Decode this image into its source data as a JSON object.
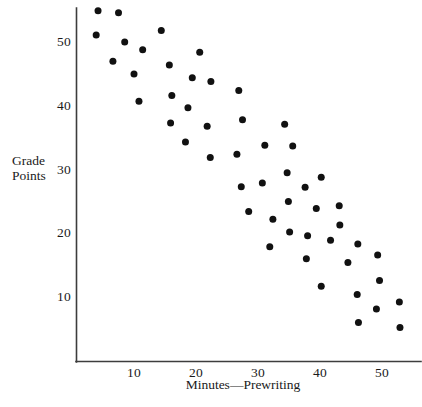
{
  "chart_data": {
    "type": "scatter",
    "title": "",
    "xlabel": "Minutes—Prewriting",
    "ylabel": "Grade Points",
    "ylabel_lines": [
      "Grade",
      "Points"
    ],
    "xlim": [
      0,
      56
    ],
    "ylim": [
      2,
      56
    ],
    "xticks": [
      10,
      20,
      30,
      40,
      50
    ],
    "xticklabels": [
      "10",
      "20",
      "30",
      "40",
      "50"
    ],
    "yticks": [
      10,
      20,
      30,
      40,
      50
    ],
    "yticklabels": [
      "10",
      "20",
      "30",
      "40",
      "50"
    ],
    "grid": false,
    "legend": null,
    "marker": "filled-circle",
    "marker_color": "#111111",
    "axis_color": "#3d3d3d",
    "points": [
      [
        4.2,
        54.9
      ],
      [
        3.9,
        51.1
      ],
      [
        7.5,
        54.6
      ],
      [
        8.5,
        50.0
      ],
      [
        6.6,
        47.0
      ],
      [
        11.4,
        48.8
      ],
      [
        10.0,
        45.0
      ],
      [
        10.8,
        40.7
      ],
      [
        14.4,
        51.8
      ],
      [
        15.7,
        46.4
      ],
      [
        16.1,
        41.6
      ],
      [
        15.9,
        37.3
      ],
      [
        20.6,
        48.4
      ],
      [
        19.4,
        44.4
      ],
      [
        18.7,
        39.7
      ],
      [
        18.3,
        34.3
      ],
      [
        22.4,
        43.8
      ],
      [
        21.8,
        36.8
      ],
      [
        22.3,
        31.9
      ],
      [
        26.9,
        42.4
      ],
      [
        27.5,
        37.8
      ],
      [
        26.6,
        32.4
      ],
      [
        27.3,
        27.3
      ],
      [
        28.5,
        23.4
      ],
      [
        31.1,
        33.8
      ],
      [
        30.7,
        27.9
      ],
      [
        32.4,
        22.2
      ],
      [
        31.9,
        17.9
      ],
      [
        34.3,
        37.1
      ],
      [
        35.6,
        33.7
      ],
      [
        34.7,
        29.5
      ],
      [
        34.9,
        25.0
      ],
      [
        35.1,
        20.2
      ],
      [
        37.6,
        27.2
      ],
      [
        38.0,
        19.6
      ],
      [
        37.8,
        16.0
      ],
      [
        39.4,
        23.9
      ],
      [
        40.2,
        28.8
      ],
      [
        40.2,
        11.7
      ],
      [
        41.7,
        18.9
      ],
      [
        43.1,
        24.3
      ],
      [
        43.2,
        21.3
      ],
      [
        44.5,
        15.4
      ],
      [
        46.1,
        18.3
      ],
      [
        46.0,
        10.4
      ],
      [
        46.2,
        6.0
      ],
      [
        49.3,
        16.6
      ],
      [
        49.6,
        12.6
      ],
      [
        49.1,
        8.1
      ],
      [
        52.8,
        9.2
      ],
      [
        52.9,
        5.2
      ]
    ]
  },
  "axes": {
    "x_tick_labels": [
      "10",
      "20",
      "30",
      "40",
      "50"
    ],
    "y_tick_labels": [
      "10",
      "20",
      "30",
      "40",
      "50"
    ],
    "x_title": "Minutes—Prewriting",
    "y_title_line1": "Grade",
    "y_title_line2": "Points"
  }
}
